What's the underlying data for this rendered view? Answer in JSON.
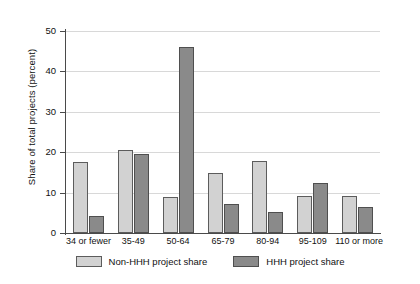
{
  "chart_data": {
    "type": "bar",
    "title": "",
    "xlabel": "",
    "ylabel": "Share of total projects (percent)",
    "ylim": [
      0,
      50
    ],
    "yticks": [
      0,
      10,
      20,
      30,
      40,
      50
    ],
    "ytick_labels": [
      "0",
      "10",
      "20",
      "30",
      "40",
      "50"
    ],
    "grid": true,
    "legend_position": "bottom-center",
    "categories": [
      "34 or fewer",
      "35-49",
      "50-64",
      "65-79",
      "80-94",
      "95-109",
      "110 or more"
    ],
    "series": [
      {
        "name": "Non-HHH project share",
        "color": "#d2d2d2",
        "values": [
          17.6,
          20.6,
          9.0,
          14.8,
          17.8,
          9.1,
          9.1
        ]
      },
      {
        "name": "HHH project share",
        "color": "#8a8a8a",
        "values": [
          4.1,
          19.5,
          46.0,
          7.3,
          5.3,
          12.4,
          6.5
        ]
      }
    ]
  },
  "colors": {
    "light_bar": "#d2d2d2",
    "dark_bar": "#8a8a8a",
    "bar_edge": "#5c5c5c",
    "gridline": "#d8d8d8",
    "axis": "#4a4a4a",
    "background": "#ffffff"
  }
}
